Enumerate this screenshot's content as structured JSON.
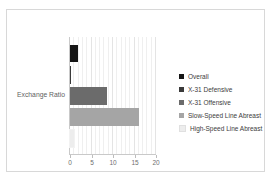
{
  "chart_data": {
    "type": "bar",
    "orientation": "horizontal",
    "title": "",
    "xlabel": "",
    "ylabel": "Exchange Ratio",
    "categories": [
      "Exchange Ratio"
    ],
    "xlim": [
      0,
      20
    ],
    "xticks": [
      0,
      5,
      10,
      15,
      20
    ],
    "xtick_labels": [
      "0",
      "5",
      "10",
      "15",
      "20"
    ],
    "grid": true,
    "legend_position": "right",
    "series": [
      {
        "name": "Overall",
        "values": [
          1.8
        ],
        "color": "#151515"
      },
      {
        "name": "X-31 Defensive",
        "values": [
          0.15
        ],
        "color": "#3a3a3a"
      },
      {
        "name": "X-31 Offensive",
        "values": [
          8.5
        ],
        "color": "#6b6b6b"
      },
      {
        "name": "Slow-Speed Line Abreast",
        "values": [
          16.0
        ],
        "color": "#a5a5a5"
      },
      {
        "name": "High-Speed Line Abreast",
        "values": [
          0.9
        ],
        "color": "#ededed"
      }
    ]
  },
  "legend": {
    "items": [
      {
        "label": "Overall",
        "color": "#151515"
      },
      {
        "label": "X-31 Defensive",
        "color": "#3a3a3a"
      },
      {
        "label": "X-31 Offensive",
        "color": "#6b6b6b"
      },
      {
        "label": "Slow-Speed Line Abreast",
        "color": "#a5a5a5"
      },
      {
        "label": "High-Speed Line Abreast",
        "color": "#ededed"
      }
    ]
  },
  "axis": {
    "category_label": "Exchange Ratio"
  }
}
